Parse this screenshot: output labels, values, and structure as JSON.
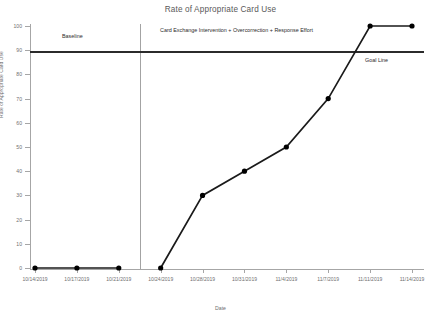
{
  "chart_data": {
    "type": "line",
    "title": "Rate of Appropriate Card Use",
    "xlabel": "Date",
    "ylabel": "Rate of Appropriate Card Use",
    "ylim": [
      0,
      100
    ],
    "yticks": [
      0,
      10,
      20,
      30,
      40,
      50,
      60,
      70,
      80,
      90,
      100
    ],
    "grid": false,
    "legend": "none",
    "categories": [
      "10/14/2019",
      "10/17/2019",
      "10/21/2019",
      "10/24/2019",
      "10/28/2019",
      "10/31/2019",
      "11/4/2019",
      "11/7/2019",
      "11/11/2019",
      "11/14/2019"
    ],
    "series": [
      {
        "name": "Baseline",
        "x": [
          "10/14/2019",
          "10/17/2019",
          "10/21/2019"
        ],
        "values": [
          0,
          0,
          0
        ]
      },
      {
        "name": "Card Exchange Intervention + Overcorrection + Response Effort",
        "x": [
          "10/24/2019",
          "10/28/2019",
          "10/31/2019",
          "11/4/2019",
          "11/7/2019",
          "11/11/2019",
          "11/14/2019"
        ],
        "values": [
          0,
          30,
          40,
          50,
          70,
          100,
          100
        ]
      }
    ],
    "annotations": [
      {
        "name": "baseline-phase-label",
        "text": "Baseline"
      },
      {
        "name": "intervention-phase-label",
        "text": "Card Exchange Intervention + Overcorrection + Response Effort"
      },
      {
        "name": "goal-line-label",
        "text": "Goal Line",
        "value": 90
      }
    ],
    "reference_lines": [
      {
        "name": "goal-line",
        "y": 90,
        "color": "#2b2b2b"
      },
      {
        "name": "phase-change-line",
        "between": [
          "10/21/2019",
          "10/24/2019"
        ],
        "color": "#a3a3a3"
      }
    ],
    "colors": {
      "line": "#1a1a1a",
      "marker": "#000000",
      "axis": "#a6a6a6",
      "text": "#6f6f70"
    }
  }
}
